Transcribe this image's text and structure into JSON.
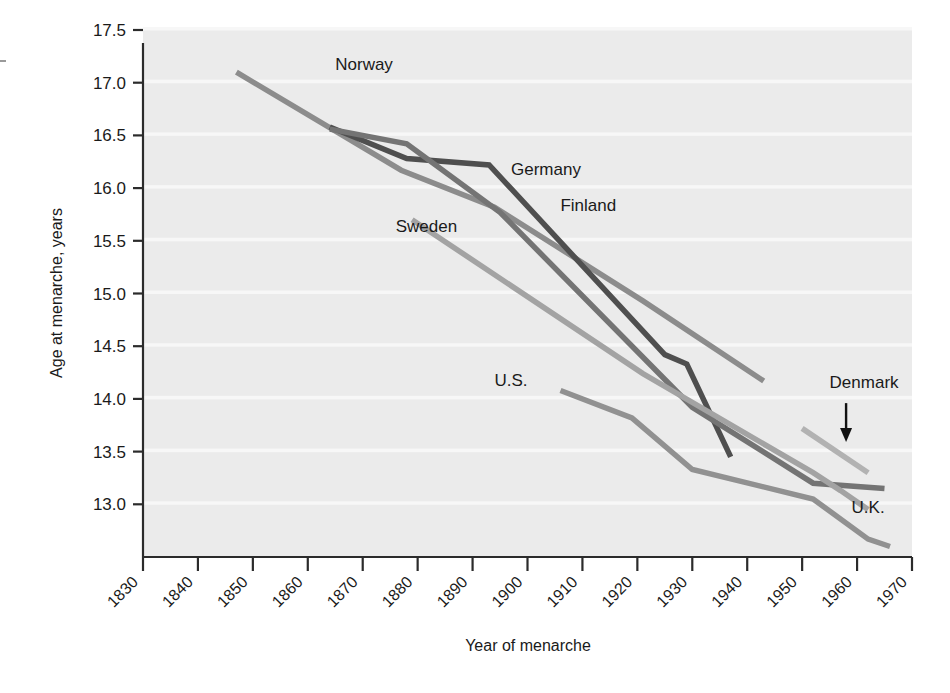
{
  "chart_data": {
    "type": "line",
    "title": "",
    "xlabel": "Year of menarche",
    "ylabel": "Age at menarche, years",
    "xlim": [
      1830,
      1970
    ],
    "ylim": [
      12.5,
      17.5
    ],
    "xticks": [
      "1830",
      "1840",
      "1850",
      "1860",
      "1870",
      "1880",
      "1890",
      "1900",
      "1910",
      "1920",
      "1930",
      "1940",
      "1950",
      "1960",
      "1970"
    ],
    "yticks": [
      "13.0",
      "13.5",
      "14.0",
      "14.5",
      "15.0",
      "15.5",
      "16.0",
      "16.5",
      "17.0",
      "17.5"
    ],
    "grid": "horizontal-white-bands",
    "legend": "inline-labels",
    "plot_bg": "#ebebeb",
    "band_color": "#f7f7f7",
    "series": [
      {
        "name": "Norway",
        "color": "#8c8c8c",
        "label": "Norway",
        "label_x": 1865,
        "label_y": 17.12,
        "points": [
          [
            1847,
            17.1
          ],
          [
            1877,
            16.17
          ],
          [
            1894,
            15.82
          ],
          [
            1921,
            14.93
          ],
          [
            1943,
            14.17
          ]
        ]
      },
      {
        "name": "Germany",
        "color": "#4f4f4f",
        "label": "Germany",
        "label_x": 1897,
        "label_y": 16.12,
        "points": [
          [
            1864,
            16.58
          ],
          [
            1878,
            16.28
          ],
          [
            1893,
            16.22
          ],
          [
            1925,
            14.42
          ],
          [
            1929,
            14.33
          ],
          [
            1937,
            13.45
          ]
        ]
      },
      {
        "name": "Finland",
        "color": "#747474",
        "label": "Finland",
        "label_x": 1906,
        "label_y": 15.78,
        "points": [
          [
            1864,
            16.56
          ],
          [
            1878,
            16.42
          ],
          [
            1895,
            15.77
          ],
          [
            1930,
            13.92
          ],
          [
            1952,
            13.2
          ],
          [
            1965,
            13.15
          ]
        ]
      },
      {
        "name": "Sweden",
        "color": "#a3a3a3",
        "label": "Sweden",
        "label_x": 1876,
        "label_y": 15.58,
        "points": [
          [
            1879,
            15.7
          ],
          [
            1921,
            14.24
          ],
          [
            1952,
            13.3
          ],
          [
            1957,
            13.13
          ],
          [
            1962,
            12.95
          ]
        ]
      },
      {
        "name": "U.S.",
        "color": "#919191",
        "label": "U.S.",
        "label_x": 1894,
        "label_y": 14.12,
        "points": [
          [
            1906,
            14.08
          ],
          [
            1919,
            13.82
          ],
          [
            1930,
            13.33
          ],
          [
            1952,
            13.05
          ],
          [
            1962,
            12.67
          ],
          [
            1966,
            12.6
          ]
        ]
      },
      {
        "name": "Denmark",
        "color": "#b2b2b2",
        "label": "Denmark",
        "label_x": 1955,
        "label_y": 14.1,
        "points": [
          [
            1950,
            13.72
          ],
          [
            1962,
            13.3
          ]
        ],
        "annotation": {
          "kind": "arrow",
          "from_x": 1958,
          "from_y": 13.96,
          "to_x": 1958,
          "to_y": 13.62
        }
      },
      {
        "name": "U.K.",
        "color": "#a8a8a8",
        "label": "U.K.",
        "label_x": 1959,
        "label_y": 12.92,
        "points": []
      }
    ]
  },
  "axis": {
    "y_title": "Age at menarche, years",
    "x_title": "Year of menarche"
  },
  "labels": {
    "norway": "Norway",
    "germany": "Germany",
    "finland": "Finland",
    "sweden": "Sweden",
    "us": "U.S.",
    "denmark": "Denmark",
    "uk": "U.K."
  }
}
